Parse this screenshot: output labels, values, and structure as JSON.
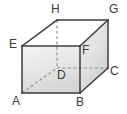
{
  "figure": {
    "name": "labelled-cuboid-diagram",
    "shape": "rectangular prism",
    "background_color": "#ffffff",
    "edge_color": "#3c3c3c",
    "hidden_edge_color": "#8a8a8a",
    "front_face_fill_top": "#f2f2f2",
    "front_face_fill_bottom": "#d8d8d8",
    "right_face_fill_top": "#efefef",
    "right_face_fill_bottom": "#d2d2d2",
    "top_face_fill": "#ffffff",
    "label_color": "#3a3a3a"
  },
  "vertices": [
    {
      "id": "A",
      "label": "A",
      "x": 22,
      "y": 93,
      "hidden": false,
      "label_x": 12,
      "label_y": 95
    },
    {
      "id": "B",
      "label": "B",
      "x": 80,
      "y": 93,
      "hidden": false,
      "label_x": 76,
      "label_y": 96
    },
    {
      "id": "C",
      "label": "C",
      "x": 108,
      "y": 68,
      "hidden": false,
      "label_x": 110,
      "label_y": 65
    },
    {
      "id": "D",
      "label": "D",
      "x": 57,
      "y": 68,
      "hidden": true,
      "label_x": 57,
      "label_y": 69
    },
    {
      "id": "E",
      "label": "E",
      "x": 22,
      "y": 46,
      "hidden": false,
      "label_x": 9,
      "label_y": 38
    },
    {
      "id": "F",
      "label": "F",
      "x": 80,
      "y": 46,
      "hidden": false,
      "label_x": 82,
      "label_y": 44
    },
    {
      "id": "G",
      "label": "G",
      "x": 108,
      "y": 20,
      "hidden": false,
      "label_x": 109,
      "label_y": 3
    },
    {
      "id": "H",
      "label": "H",
      "x": 57,
      "y": 20,
      "hidden": false,
      "label_x": 51,
      "label_y": 3
    }
  ],
  "edges": {
    "solid": [
      {
        "from": "A",
        "to": "B",
        "name": "edge-a-b"
      },
      {
        "from": "B",
        "to": "F",
        "name": "edge-b-f"
      },
      {
        "from": "F",
        "to": "E",
        "name": "edge-f-e"
      },
      {
        "from": "E",
        "to": "A",
        "name": "edge-e-a"
      },
      {
        "from": "B",
        "to": "C",
        "name": "edge-b-c"
      },
      {
        "from": "C",
        "to": "G",
        "name": "edge-c-g"
      },
      {
        "from": "G",
        "to": "F",
        "name": "edge-g-f"
      },
      {
        "from": "E",
        "to": "H",
        "name": "edge-e-h"
      },
      {
        "from": "H",
        "to": "G",
        "name": "edge-h-g"
      }
    ],
    "dashed": [
      {
        "from": "H",
        "to": "D",
        "name": "edge-h-d-hidden"
      },
      {
        "from": "D",
        "to": "C",
        "name": "edge-d-c-hidden"
      },
      {
        "from": "A",
        "to": "D",
        "name": "edge-a-d-hidden"
      }
    ]
  },
  "faces": {
    "front": {
      "name": "face-front-abfe",
      "points": "22,93 80,93 80,46 22,46"
    },
    "right": {
      "name": "face-right-bcgf",
      "points": "80,93 108,68 108,20 80,46"
    },
    "top": {
      "name": "face-top-ehgf",
      "points": "22,46 57,20 108,20 80,46"
    }
  }
}
